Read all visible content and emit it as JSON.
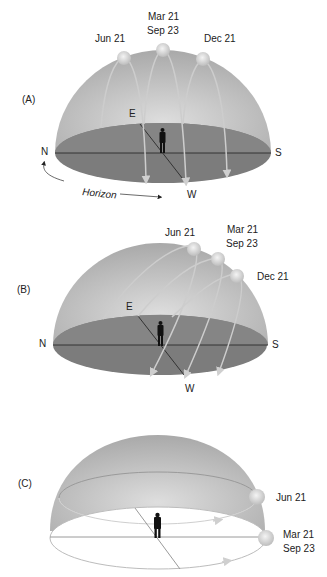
{
  "panels": [
    {
      "id": "A",
      "label": "(A)",
      "directions": {
        "north": "N",
        "south": "S",
        "east": "E",
        "west": "W"
      },
      "horizon_label": "Horizon",
      "suns": [
        {
          "date": "Jun 21"
        },
        {
          "date_line1": "Mar 21",
          "date_line2": "Sep 23"
        },
        {
          "date": "Dec 21"
        }
      ]
    },
    {
      "id": "B",
      "label": "(B)",
      "directions": {
        "north": "N",
        "south": "S",
        "east": "E",
        "west": "W"
      },
      "suns": [
        {
          "date": "Jun 21"
        },
        {
          "date_line1": "Mar 21",
          "date_line2": "Sep 23"
        },
        {
          "date": "Dec 21"
        }
      ]
    },
    {
      "id": "C",
      "label": "(C)",
      "suns": [
        {
          "date": "Jun 21"
        },
        {
          "date_line1": "Mar 21",
          "date_line2": "Sep 23"
        }
      ]
    }
  ],
  "colors": {
    "dome": "#b8b8b8",
    "dome_light": "#d6d6d6",
    "ground": "#7a7a7a",
    "ground_dark": "#6e6e6e",
    "sun": "#dcdcdc",
    "path": "#c8c8c8",
    "figure": "#111111"
  }
}
